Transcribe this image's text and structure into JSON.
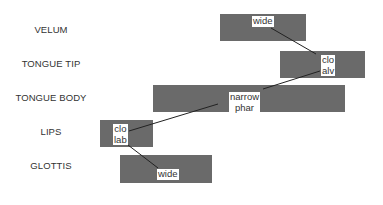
{
  "diagram": {
    "type": "gestural-score",
    "tiers": [
      {
        "name": "VELUM",
        "label_y": 30,
        "box": {
          "x": 220,
          "y": 14,
          "w": 86,
          "h": 27
        },
        "gesture_label": [
          "wide"
        ],
        "label_pos": {
          "x": 252,
          "y": 16
        }
      },
      {
        "name": "TONGUE TIP",
        "label_y": 64,
        "box": {
          "x": 280,
          "y": 51,
          "w": 85,
          "h": 27
        },
        "gesture_label": [
          "clo",
          "alv"
        ],
        "label_pos": {
          "x": 321,
          "y": 55
        }
      },
      {
        "name": "TONGUE BODY",
        "label_y": 98,
        "box": {
          "x": 153,
          "y": 85,
          "w": 192,
          "h": 27
        },
        "gesture_label": [
          "narrow",
          "phar"
        ],
        "label_pos": {
          "x": 229,
          "y": 92
        }
      },
      {
        "name": "LIPS",
        "label_y": 132,
        "box": {
          "x": 100,
          "y": 120,
          "w": 53,
          "h": 27
        },
        "gesture_label": [
          "clo",
          "lab"
        ],
        "label_pos": {
          "x": 113,
          "y": 124
        }
      },
      {
        "name": "GLOTTIS",
        "label_y": 166,
        "box": {
          "x": 120,
          "y": 155,
          "w": 92,
          "h": 28
        },
        "gesture_label": [
          "wide"
        ],
        "label_pos": {
          "x": 157,
          "y": 169
        }
      }
    ],
    "phasing_lines": [
      {
        "from": "VELUM.wide",
        "to": "TONGUE TIP.clo alv",
        "x1": 271,
        "y1": 28,
        "x2": 316,
        "y2": 54
      },
      {
        "from": "TONGUE TIP.clo alv",
        "to": "TONGUE BODY.narrow phar",
        "x1": 320,
        "y1": 71,
        "x2": 263,
        "y2": 89
      },
      {
        "from": "TONGUE BODY.narrow phar",
        "to": "LIPS.clo lab",
        "x1": 218,
        "y1": 104,
        "x2": 129,
        "y2": 131
      },
      {
        "from": "LIPS.clo lab",
        "to": "GLOTTIS.wide",
        "x1": 128,
        "y1": 145,
        "x2": 158,
        "y2": 168
      }
    ]
  }
}
